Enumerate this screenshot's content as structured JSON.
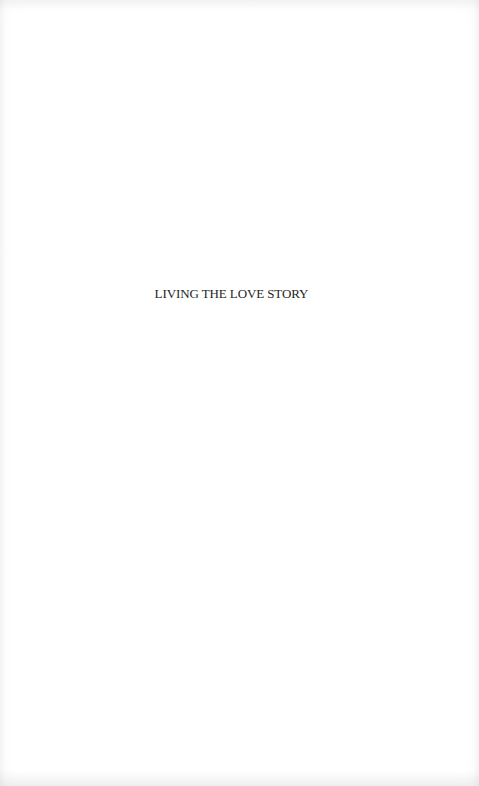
{
  "page": {
    "half_title": "LIVING THE LOVE STORY"
  }
}
